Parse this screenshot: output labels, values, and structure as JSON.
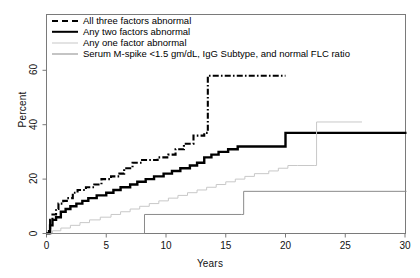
{
  "chart_data": {
    "type": "line",
    "title": "",
    "xlabel": "Years",
    "ylabel": "Percent",
    "xlim": [
      0,
      30
    ],
    "ylim": [
      0,
      68
    ],
    "xticks": [
      0,
      5,
      10,
      15,
      20,
      25,
      30
    ],
    "yticks": [
      0,
      20,
      40,
      60
    ],
    "grid": false,
    "legend_position": "top-left",
    "series": [
      {
        "name": "All three factors abnormal",
        "style": "dashed-bold",
        "color": "#000000",
        "points": [
          [
            0,
            0
          ],
          [
            0.2,
            2
          ],
          [
            0.3,
            5
          ],
          [
            0.5,
            7
          ],
          [
            0.8,
            9
          ],
          [
            1.0,
            11
          ],
          [
            1.4,
            12
          ],
          [
            1.7,
            13
          ],
          [
            2.2,
            15
          ],
          [
            2.6,
            16
          ],
          [
            3.3,
            17
          ],
          [
            4.0,
            18
          ],
          [
            4.6,
            20
          ],
          [
            5.4,
            21
          ],
          [
            6.1,
            22
          ],
          [
            6.5,
            24
          ],
          [
            7.2,
            26
          ],
          [
            8.0,
            27
          ],
          [
            9.3,
            28
          ],
          [
            10.2,
            29
          ],
          [
            10.8,
            31
          ],
          [
            11.5,
            33
          ],
          [
            12.3,
            36
          ],
          [
            13.2,
            37
          ],
          [
            13.5,
            58
          ],
          [
            20.0,
            58
          ]
        ]
      },
      {
        "name": "Any two factors abnormal",
        "style": "solid-bold",
        "color": "#000000",
        "points": [
          [
            0,
            0
          ],
          [
            0.3,
            3
          ],
          [
            0.5,
            5
          ],
          [
            0.8,
            6
          ],
          [
            1.2,
            8
          ],
          [
            1.6,
            9
          ],
          [
            2.0,
            10
          ],
          [
            2.5,
            11
          ],
          [
            3.0,
            12
          ],
          [
            3.5,
            13
          ],
          [
            4.2,
            14
          ],
          [
            5.0,
            15
          ],
          [
            5.6,
            16
          ],
          [
            6.2,
            17
          ],
          [
            7.0,
            18
          ],
          [
            7.6,
            19
          ],
          [
            8.3,
            20
          ],
          [
            9.0,
            21
          ],
          [
            9.8,
            22
          ],
          [
            10.5,
            23
          ],
          [
            11.2,
            24
          ],
          [
            12.0,
            25
          ],
          [
            12.6,
            26
          ],
          [
            13.2,
            28
          ],
          [
            13.8,
            29
          ],
          [
            14.4,
            30
          ],
          [
            15.2,
            31
          ],
          [
            16.0,
            32
          ],
          [
            17.0,
            32
          ],
          [
            19.8,
            32
          ],
          [
            20.0,
            37
          ],
          [
            30.2,
            37
          ]
        ]
      },
      {
        "name": "Any one factor abnormal",
        "style": "solid-thin",
        "color": "#c8c8c8",
        "points": [
          [
            0,
            0
          ],
          [
            0.5,
            1
          ],
          [
            1.2,
            2
          ],
          [
            2.0,
            3
          ],
          [
            2.8,
            4
          ],
          [
            3.6,
            5
          ],
          [
            4.5,
            6
          ],
          [
            5.4,
            7
          ],
          [
            6.2,
            8
          ],
          [
            7.0,
            9
          ],
          [
            7.8,
            10
          ],
          [
            8.6,
            11
          ],
          [
            9.4,
            12
          ],
          [
            10.2,
            13
          ],
          [
            11.0,
            14
          ],
          [
            11.8,
            15
          ],
          [
            12.6,
            16
          ],
          [
            13.4,
            17
          ],
          [
            14.2,
            18
          ],
          [
            15.0,
            19
          ],
          [
            15.8,
            20
          ],
          [
            16.6,
            21
          ],
          [
            17.4,
            22
          ],
          [
            18.6,
            23
          ],
          [
            19.4,
            24
          ],
          [
            20.2,
            25
          ],
          [
            21.0,
            25
          ],
          [
            22.4,
            25
          ],
          [
            22.6,
            41
          ],
          [
            26.4,
            41
          ]
        ]
      },
      {
        "name": "Serum M-spike <1.5 gm/dL, IgG Subtype, and normal FLC ratio",
        "style": "solid-mid",
        "color": "#8a8a8a",
        "points": [
          [
            0,
            0
          ],
          [
            8.0,
            0
          ],
          [
            8.2,
            7
          ],
          [
            16.3,
            7
          ],
          [
            16.5,
            15.5
          ],
          [
            30.2,
            15.5
          ]
        ]
      }
    ]
  },
  "axes": {
    "ylabel": "Percent",
    "xlabel": "Years",
    "yticks": [
      "0",
      "20",
      "40",
      "60"
    ],
    "xticks": [
      "0",
      "5",
      "10",
      "15",
      "20",
      "25",
      "30"
    ]
  },
  "legend": {
    "items": [
      {
        "label": "All three factors abnormal",
        "key": "dashed-bold-key"
      },
      {
        "label": "Any two factors abnormal",
        "key": "solid-bold-key"
      },
      {
        "label": "Any one factor abnormal",
        "key": "solid-light-key"
      },
      {
        "label": "Serum M-spike <1.5 gm/dL, IgG Subtype, and normal FLC ratio",
        "key": "solid-mid-key"
      }
    ]
  },
  "colors": {
    "frame": "#7a7a7a",
    "series_all_three": "#000000",
    "series_any_two": "#000000",
    "series_any_one": "#c8c8c8",
    "series_mspike": "#8a8a8a",
    "background": "#ffffff"
  }
}
